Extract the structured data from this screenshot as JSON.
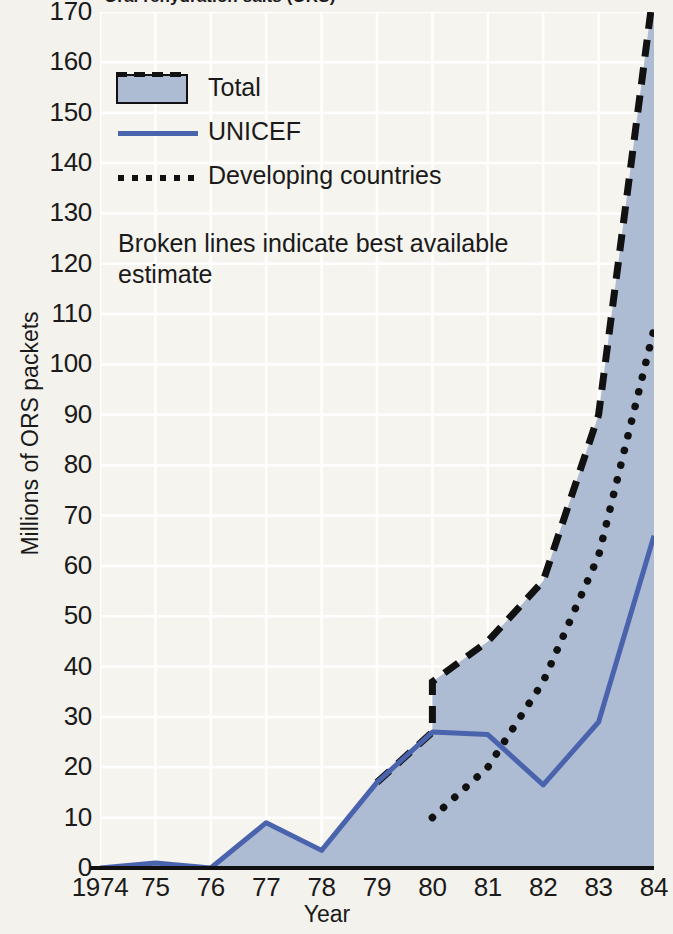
{
  "chart_data": {
    "type": "area",
    "title": "Oral rehydration salts (ORS)",
    "xlabel": "Year",
    "ylabel": "Millions of ORS packets",
    "ylim": [
      0,
      170
    ],
    "ytick_step": 10,
    "yticks": [
      "170",
      "160",
      "150",
      "140",
      "130",
      "120",
      "110",
      "100",
      "90",
      "80",
      "70",
      "60",
      "50",
      "40",
      "30",
      "20",
      "10",
      "0"
    ],
    "xticks": [
      "1974",
      "75",
      "76",
      "77",
      "78",
      "79",
      "80",
      "81",
      "82",
      "83",
      "84"
    ],
    "x": [
      1974,
      1975,
      1976,
      1977,
      1978,
      1979,
      1980,
      1981,
      1982,
      1983,
      1984
    ],
    "grid": true,
    "grid_color": "#ffffff",
    "background": "#f6f4ee",
    "legend_position": "upper-left",
    "annotation": "Broken lines indicate best available estimate",
    "series": [
      {
        "name": "Total",
        "style": "filled-area-dashed-edge",
        "color": "#adbbd3",
        "edge_color": "#111111",
        "values": [
          0,
          1,
          0,
          9,
          3.5,
          17,
          37,
          45,
          57,
          90,
          175
        ]
      },
      {
        "name": "UNICEF",
        "style": "solid-line",
        "color": "#4a63ad",
        "values": [
          0,
          1,
          0,
          9,
          3.5,
          17,
          27,
          26.5,
          16.5,
          29,
          66
        ]
      },
      {
        "name": "Developing countries",
        "style": "dotted-line",
        "color": "#111111",
        "values": [
          null,
          null,
          null,
          null,
          null,
          null,
          10,
          20,
          37,
          62,
          107
        ]
      }
    ]
  },
  "legend": {
    "items": [
      {
        "label": "Total"
      },
      {
        "label": "UNICEF"
      },
      {
        "label": "Developing countries"
      }
    ]
  }
}
